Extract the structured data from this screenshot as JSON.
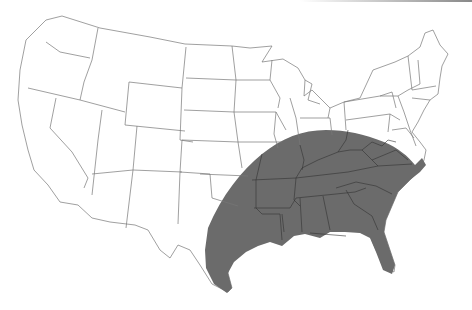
{
  "map": {
    "type": "choropleth-outline",
    "region": "Contiguous United States",
    "shaded_region": {
      "description": "Southeastern United States arc",
      "fill_color": "#6b6b6b",
      "states": [
        "Texas (eastern)",
        "Oklahoma (eastern)",
        "Arkansas",
        "Louisiana",
        "Missouri (southeastern)",
        "Illinois (southern)",
        "Indiana (southern)",
        "Ohio (southern)",
        "Kentucky",
        "Tennessee",
        "Mississippi",
        "Alabama",
        "Georgia",
        "Florida",
        "South Carolina",
        "North Carolina",
        "Virginia",
        "West Virginia"
      ]
    },
    "colors": {
      "background": "#ffffff",
      "state_fill": "#ffffff",
      "state_border": "#777777",
      "shaded_fill": "#6b6b6b",
      "shaded_border": "#333333"
    }
  }
}
